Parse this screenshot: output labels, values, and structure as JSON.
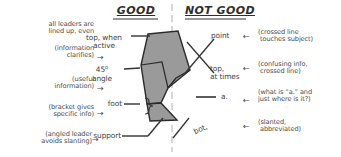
{
  "diagram": {
    "title_left": "GOOD",
    "title_right": "NOT GOOD",
    "subject_shape": {
      "fill_color": "#9a9a9a",
      "stroke_color": "#2b2b2b",
      "description": "sectioned bent part outline"
    },
    "centerline": {
      "style": "dashed",
      "color": "#9a9a9a"
    }
  },
  "good_side": {
    "notes": [
      {
        "id": "note-aligned",
        "text": "all leaders are\nlined up, even"
      },
      {
        "id": "note-clarifies",
        "text": "(information\nclarifies)"
      },
      {
        "id": "note-useful",
        "text": "(useful\ninformation)"
      },
      {
        "id": "note-bracket",
        "text": "(bracket gives\nspecific info)"
      },
      {
        "id": "note-angled",
        "text": "(angled leader\navoids slanting)"
      }
    ],
    "labels": [
      {
        "id": "label-top-active",
        "text": "top, when\nactive"
      },
      {
        "id": "label-45-angle",
        "text_main": "45",
        "text_sup": "o",
        "text_rest": "\nangle"
      },
      {
        "id": "label-foot",
        "text": "foot"
      },
      {
        "id": "label-support",
        "text": "support"
      }
    ],
    "arrow_glyph": "→"
  },
  "not_good_side": {
    "labels": [
      {
        "id": "label-point",
        "text": "point"
      },
      {
        "id": "label-top-at-times",
        "text": "top,\nat times"
      },
      {
        "id": "label-a",
        "text": "a."
      },
      {
        "id": "label-bot",
        "text": "bot,"
      }
    ],
    "notes": [
      {
        "id": "note-crossed-touches",
        "text": "(crossed line\n touches subject)"
      },
      {
        "id": "note-confusing",
        "text": "(confusing info,\n crossed line)"
      },
      {
        "id": "note-what-is-a",
        "text": "(what is “a.” and\njust where is it?)"
      },
      {
        "id": "note-slanted",
        "text": "(slanted,\n abbreviated)"
      }
    ],
    "arrow_glyph": "←"
  }
}
